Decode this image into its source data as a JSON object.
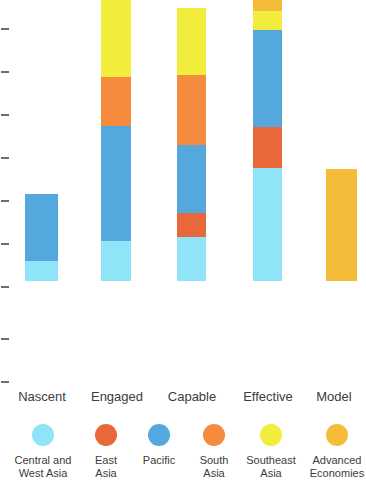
{
  "chart_data": {
    "type": "bar",
    "subtype": "stacked-column",
    "title": "",
    "subtitle": "",
    "xlabel": "",
    "ylabel": "",
    "grid": false,
    "legend_position": "bottom",
    "axis": {
      "y_tick_count": 9,
      "y_tick_labels": [],
      "ylim": [
        0,
        9
      ],
      "baseline_note": "unlabeled tick marks on left axis"
    },
    "categories": [
      "Nascent",
      "Engaged",
      "Capable",
      "Effective",
      "Model"
    ],
    "series": [
      {
        "name": "Central and West Asia",
        "color": "#8fe4f7",
        "values": [
          1,
          1,
          2,
          3,
          0
        ]
      },
      {
        "name": "East Asia",
        "color": "#e8683a",
        "values": [
          0,
          0,
          1,
          1,
          0
        ]
      },
      {
        "name": "Pacific",
        "color": "#55a8dd",
        "values": [
          2,
          3,
          2,
          2,
          0
        ]
      },
      {
        "name": "South Asia",
        "color": "#f58b3c",
        "values": [
          0,
          1,
          2,
          0,
          0
        ]
      },
      {
        "name": "Southeast Asia",
        "color": "#f2ec3d",
        "values": [
          0,
          3,
          2,
          0,
          0
        ]
      },
      {
        "name": "Advanced Economies",
        "color": "#f5bc3a",
        "values": [
          0,
          0,
          0,
          1,
          2
        ]
      }
    ],
    "stacks": [
      {
        "category": "Nascent",
        "total": 3,
        "segments": [
          {
            "series": "Central and West Asia",
            "value": 1,
            "color": "#8fe4f7"
          },
          {
            "series": "Pacific",
            "value": 2,
            "color": "#55a8dd"
          }
        ]
      },
      {
        "category": "Engaged",
        "total": 7,
        "segments": [
          {
            "series": "Central and West Asia",
            "value": 1,
            "color": "#8fe4f7"
          },
          {
            "series": "Pacific",
            "value": 3,
            "color": "#55a8dd"
          },
          {
            "series": "South Asia",
            "value": 1,
            "color": "#f58b3c"
          },
          {
            "series": "Southeast Asia",
            "value": 3,
            "color": "#f2ec3d"
          }
        ]
      },
      {
        "category": "Capable",
        "total": 6,
        "segments": [
          {
            "series": "Central and West Asia",
            "value": 2,
            "color": "#8fe4f7"
          },
          {
            "series": "East Asia",
            "value": 1,
            "color": "#e8683a"
          },
          {
            "series": "Pacific",
            "value": 2,
            "color": "#55a8dd"
          },
          {
            "series": "South Asia",
            "value": 2,
            "color": "#f58b3c"
          },
          {
            "series": "Southeast Asia",
            "value": 2,
            "color": "#f2ec3d"
          }
        ]
      },
      {
        "category": "Effective",
        "total": 7,
        "segments": [
          {
            "series": "Central and West Asia",
            "value": 3,
            "color": "#8fe4f7"
          },
          {
            "series": "East Asia",
            "value": 1,
            "color": "#e8683a"
          },
          {
            "series": "Pacific",
            "value": 2,
            "color": "#55a8dd"
          },
          {
            "series": "Southeast Asia",
            "value": 1,
            "color": "#f2ec3d"
          },
          {
            "series": "Advanced Economies",
            "value": 2,
            "color": "#f5bc3a"
          }
        ]
      },
      {
        "category": "Model",
        "total": 2,
        "segments": [
          {
            "series": "Advanced Economies",
            "value": 2,
            "color": "#f5bc3a"
          }
        ]
      }
    ],
    "pixel_layout": {
      "baseline_y": 381,
      "bars": [
        {
          "category": "Nascent",
          "x": 25,
          "width": 33,
          "top_y": 294,
          "boundaries": [
            361
          ]
        },
        {
          "category": "Engaged",
          "x": 101,
          "width": 30,
          "top_y": 58,
          "boundaries": [
            177,
            226,
            341
          ]
        },
        {
          "category": "Capable",
          "x": 177,
          "width": 29,
          "top_y": 108,
          "boundaries": [
            175,
            245,
            313,
            337
          ]
        },
        {
          "category": "Effective",
          "x": 253,
          "width": 29,
          "top_y": 59,
          "boundaries": [
            111,
            130,
            227,
            268
          ]
        },
        {
          "category": "Model",
          "x": 326,
          "width": 31,
          "top_y": 269,
          "boundaries": []
        }
      ]
    }
  },
  "axis_ticks": [
    {
      "y": 28
    },
    {
      "y": 71
    },
    {
      "y": 114
    },
    {
      "y": 157
    },
    {
      "y": 200
    },
    {
      "y": 243
    },
    {
      "y": 286
    },
    {
      "y": 338
    },
    {
      "y": 381
    }
  ],
  "category_labels": [
    {
      "text": "Nascent",
      "left": 0,
      "width": 84
    },
    {
      "text": "Engaged",
      "left": 76,
      "width": 82
    },
    {
      "text": "Capable",
      "left": 152,
      "width": 80
    },
    {
      "text": "Effective",
      "left": 226,
      "width": 84
    },
    {
      "text": "Model",
      "left": 302,
      "width": 64
    }
  ],
  "legend": {
    "items": [
      {
        "label": "Central and\nWest Asia",
        "color": "#8fe4f7",
        "left": 4,
        "width": 78
      },
      {
        "label": "East\nAsia",
        "color": "#e8683a",
        "left": 84,
        "width": 44
      },
      {
        "label": "Pacific",
        "color": "#55a8dd",
        "left": 130,
        "width": 58
      },
      {
        "label": "South\nAsia",
        "color": "#f58b3c",
        "left": 190,
        "width": 48
      },
      {
        "label": "Southeast\nAsia",
        "color": "#f2ec3d",
        "left": 240,
        "width": 62
      },
      {
        "label": "Advanced\nEconomies",
        "color": "#f5bc3a",
        "left": 304,
        "width": 66
      }
    ]
  }
}
